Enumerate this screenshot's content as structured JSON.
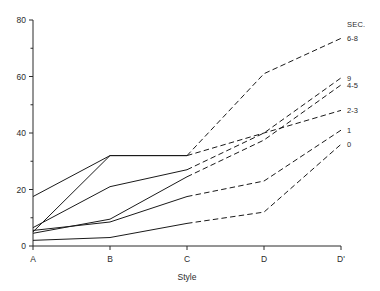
{
  "chart_data": {
    "type": "line",
    "title": "",
    "xlabel": "Style",
    "ylabel": "",
    "x": [
      "A",
      "B",
      "C",
      "D",
      "D'"
    ],
    "xtick_labels": [
      "A",
      "B",
      "C",
      "D",
      "D'"
    ],
    "ytick_labels": [
      "0",
      "20",
      "40",
      "60",
      "80"
    ],
    "ytick_values": [
      0,
      20,
      40,
      60,
      80
    ],
    "yminor_values": [
      10,
      30,
      50,
      70
    ],
    "ylim": [
      0,
      80
    ],
    "grid": false,
    "legend_position": "right",
    "legend_header": "SEC.",
    "solid_until": "C",
    "note_linestyle": "solid from A to C, dashed from C to D'",
    "series": [
      {
        "name": "6-8",
        "values": [
          5.0,
          32.0,
          32.0,
          61.0,
          73.5
        ]
      },
      {
        "name": "9",
        "values": [
          6.5,
          21.0,
          27.0,
          40.0,
          59.5
        ]
      },
      {
        "name": "4-5",
        "values": [
          4.5,
          9.5,
          24.5,
          37.5,
          57.0
        ]
      },
      {
        "name": "2-3",
        "values": [
          17.5,
          32.0,
          32.0,
          40.0,
          48.0
        ]
      },
      {
        "name": "1",
        "values": [
          5.5,
          8.5,
          17.5,
          23.0,
          41.0
        ]
      },
      {
        "name": "0",
        "values": [
          2.0,
          3.0,
          8.0,
          12.0,
          36.0
        ]
      }
    ]
  },
  "axes": {
    "x_title": "Style"
  }
}
